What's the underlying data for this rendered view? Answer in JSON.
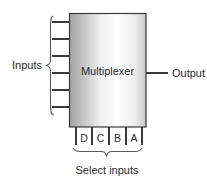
{
  "diagram": {
    "title_text": "Multiplexer",
    "labels": {
      "inputs": "Inputs",
      "output": "Output",
      "select_inputs": "Select inputs"
    },
    "block": {
      "name": "Multiplexer",
      "fill_left": "#a9a9a9",
      "fill_mid": "#ffffff",
      "fill_right": "#c8c8c8",
      "border_color": "#3a3a3a",
      "x": 69,
      "y": 13,
      "width": 77,
      "height": 114
    },
    "input_pins": [
      {
        "id": "in-1",
        "y": 22
      },
      {
        "id": "in-2",
        "y": 39
      },
      {
        "id": "in-3",
        "y": 56
      },
      {
        "id": "in-4",
        "y": 73
      },
      {
        "id": "in-5",
        "y": 90
      },
      {
        "id": "in-6",
        "y": 107
      }
    ],
    "input_pin_x_start": 52,
    "output_pin": {
      "id": "out-1",
      "y": 73,
      "x_start": 146,
      "x_end": 168
    },
    "select_pins": [
      {
        "label": "D",
        "x": 84
      },
      {
        "label": "C",
        "x": 100
      },
      {
        "label": "B",
        "x": 117
      },
      {
        "label": "A",
        "x": 134
      }
    ],
    "select_pin_dividers": [
      76,
      92,
      109,
      126,
      142
    ],
    "select_pin_y_end": 145,
    "colors": {
      "stroke": "#3a3a3a",
      "brace": "#5a5a5a",
      "text": "#2b2b2b",
      "background": "#ffffff"
    }
  }
}
